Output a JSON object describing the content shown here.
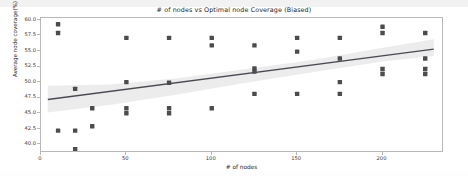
{
  "chart_data": {
    "type": "scatter",
    "title": "# of nodes vs Optimal node Coverage (Biased)",
    "xlabel": "# of nodes",
    "ylabel": "Average node coverage(%)",
    "xlim": [
      0,
      236
    ],
    "ylim": [
      38.6,
      60.3
    ],
    "xticks": [
      0,
      50,
      100,
      150,
      200
    ],
    "xticklabels": [
      "0",
      "50",
      "100",
      "150",
      "200"
    ],
    "yticks": [
      40.0,
      42.5,
      45.0,
      47.5,
      50.0,
      52.5,
      55.0,
      57.5,
      60.0
    ],
    "yticklabels": [
      "40.0",
      "42.5",
      "45.0",
      "47.5",
      "50.0",
      "52.5",
      "55.0",
      "57.5",
      "60.0"
    ],
    "grid": false,
    "legend": null,
    "marker_color": "#4c4c4c",
    "marker_size": 2.2,
    "line_color": "#4a4a52",
    "band_color": "#e9e9e9",
    "points": [
      {
        "x": 10,
        "y": 59.3
      },
      {
        "x": 10,
        "y": 57.9
      },
      {
        "x": 10,
        "y": 42.2
      },
      {
        "x": 20,
        "y": 48.9
      },
      {
        "x": 20,
        "y": 42.2
      },
      {
        "x": 20,
        "y": 39.2
      },
      {
        "x": 30,
        "y": 45.8
      },
      {
        "x": 30,
        "y": 42.9
      },
      {
        "x": 50,
        "y": 57.1
      },
      {
        "x": 50,
        "y": 50.0
      },
      {
        "x": 50,
        "y": 45.8
      },
      {
        "x": 50,
        "y": 45.0
      },
      {
        "x": 75,
        "y": 57.1
      },
      {
        "x": 75,
        "y": 49.9
      },
      {
        "x": 75,
        "y": 45.8
      },
      {
        "x": 75,
        "y": 45.0
      },
      {
        "x": 100,
        "y": 57.1
      },
      {
        "x": 100,
        "y": 55.9
      },
      {
        "x": 100,
        "y": 45.8
      },
      {
        "x": 125,
        "y": 55.9
      },
      {
        "x": 125,
        "y": 52.2
      },
      {
        "x": 125,
        "y": 51.7
      },
      {
        "x": 125,
        "y": 48.1
      },
      {
        "x": 150,
        "y": 57.1
      },
      {
        "x": 150,
        "y": 54.9
      },
      {
        "x": 150,
        "y": 48.1
      },
      {
        "x": 175,
        "y": 57.1
      },
      {
        "x": 175,
        "y": 53.8
      },
      {
        "x": 175,
        "y": 50.0
      },
      {
        "x": 175,
        "y": 48.1
      },
      {
        "x": 200,
        "y": 58.9
      },
      {
        "x": 200,
        "y": 57.9
      },
      {
        "x": 200,
        "y": 52.1
      },
      {
        "x": 200,
        "y": 51.3
      },
      {
        "x": 225,
        "y": 57.9
      },
      {
        "x": 225,
        "y": 53.8
      },
      {
        "x": 225,
        "y": 52.1
      },
      {
        "x": 225,
        "y": 51.3
      }
    ],
    "regression_line": {
      "x_start": 4,
      "y_start": 47.2,
      "x_end": 230,
      "y_end": 55.3
    },
    "confidence_band": {
      "x": [
        4,
        40,
        80,
        120,
        160,
        200,
        230
      ],
      "upper": [
        49.4,
        49.6,
        50.6,
        52.1,
        53.6,
        55.5,
        56.9
      ],
      "lower": [
        45.1,
        46.3,
        48.0,
        49.9,
        51.6,
        53.3,
        54.2
      ]
    }
  }
}
